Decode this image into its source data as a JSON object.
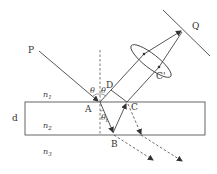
{
  "diagram": {
    "type": "thin-film interference optics diagram",
    "labels": {
      "P": "P",
      "Q": "Q",
      "A": "A",
      "B": "B",
      "C": "C",
      "C_prime": "C'",
      "D": "D",
      "d": "d",
      "n1": "n",
      "n1_sub": "1",
      "n2": "n",
      "n2_sub": "2",
      "n3": "n",
      "n3_sub": "3",
      "theta_left": "θ",
      "theta_right": "θ",
      "theta_t": "θ",
      "theta_t_sub": "t"
    },
    "colors": {
      "stroke": "#444444",
      "background": "#ffffff"
    }
  }
}
